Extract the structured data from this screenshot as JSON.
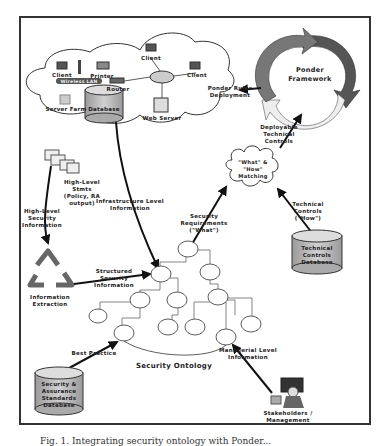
{
  "figure": {
    "cloud": {
      "nodes": {
        "client_left": "Client",
        "wireless_lan": "Wireless LAN",
        "printer": "Printer",
        "router": "Router",
        "client_top": "Client",
        "client_right": "Client",
        "server_farm": "Server Farm",
        "database": "Database",
        "web_server": "Web Server"
      }
    },
    "ponder_framework": {
      "label_line1": "Ponder",
      "label_line2": "Framework"
    },
    "edges": {
      "ponder_rules": {
        "line1": "Ponder Rules",
        "line2": "Deployment"
      },
      "deployable": {
        "line1": "Deployable",
        "line2": "Technical",
        "line3": "Controls"
      },
      "infrastructure": {
        "line1": "Infrastructure Level",
        "line2": "Information"
      },
      "high_level_security": {
        "line1": "High-Level",
        "line2": "Security",
        "line3": "Information"
      },
      "structured": {
        "line1": "Structured",
        "line2": "Security",
        "line3": "Information"
      },
      "security_requirements": {
        "line1": "Security",
        "line2": "Requirements",
        "line3": "(\"What\")"
      },
      "technical_controls_how": {
        "line1": "Technical",
        "line2": "Controls",
        "line3": "(\"How\")"
      },
      "best_practice": {
        "line1": "Best Practice"
      },
      "managerial": {
        "line1": "Managerial Level",
        "line2": "Information"
      }
    },
    "high_level_stmts": {
      "line1": "High-Level",
      "line2": "Stmts",
      "line3": "(Policy, RA",
      "line4": "output)"
    },
    "matching": {
      "line1": "\"What\" &",
      "line2": "\"How\"",
      "line3": "Matching"
    },
    "technical_controls_db": {
      "line1": "Technical",
      "line2": "Controls",
      "line3": "Database"
    },
    "information_extraction": {
      "line1": "Information",
      "line2": "Extraction"
    },
    "security_ontology": {
      "label": "Security Ontology"
    },
    "standards_db": {
      "line1": "Security &",
      "line2": "Assurance",
      "line3": "Standards",
      "line4": "Database"
    },
    "stakeholders": {
      "line1": "Stakeholders /",
      "line2": "Management"
    },
    "colors": {
      "ponder_dark": "#555555",
      "ponder_mid": "#777777",
      "ponder_light": "#eeeeee",
      "db_fill": "#bbbbbb",
      "recycle": "#666666"
    }
  },
  "caption": {
    "text": "Fig. 1. Integrating security ontology with Ponder..."
  }
}
